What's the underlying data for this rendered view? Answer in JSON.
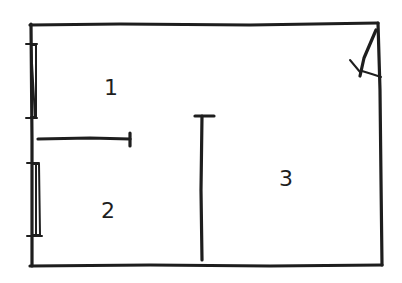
{
  "diagram": {
    "type": "floor-plan-sketch",
    "style": "hand-drawn",
    "colors": {
      "ink": "#1e1e1e",
      "background": "#ffffff"
    },
    "rooms": [
      {
        "id": "room-1",
        "label": "1",
        "x": 104,
        "y": 95
      },
      {
        "id": "room-2",
        "label": "2",
        "x": 101,
        "y": 218
      },
      {
        "id": "room-3",
        "label": "3",
        "x": 279,
        "y": 186
      }
    ],
    "features": {
      "windows": [
        {
          "wall": "left",
          "y_start": 44,
          "y_end": 118
        },
        {
          "wall": "left",
          "y_start": 162,
          "y_end": 236
        }
      ],
      "door": {
        "corner": "top-right",
        "swing": "arc"
      },
      "interior_walls": [
        {
          "orientation": "horizontal",
          "between": [
            "1",
            "2"
          ]
        },
        {
          "orientation": "vertical",
          "partial": true,
          "separates": [
            "1/2",
            "3"
          ]
        }
      ]
    }
  }
}
